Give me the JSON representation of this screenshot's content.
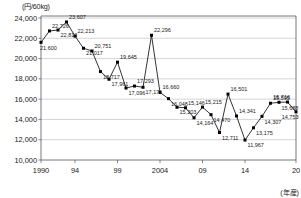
{
  "chart_data": {
    "type": "line",
    "title": "",
    "subtitle": "",
    "xlabel": "(年産)",
    "ylabel": "(円/60kg)",
    "unit_label": "(円/60kg)",
    "x_unit_label": "(年産)",
    "grid": true,
    "legend": "none",
    "ylim": [
      10000,
      24000
    ],
    "ytick_step": 2000,
    "y_ticks": [
      "10,000",
      "12,000",
      "14,000",
      "16,000",
      "18,000",
      "20,000",
      "22,000",
      "24,000"
    ],
    "y_tick_values": [
      10000,
      12000,
      14000,
      16000,
      18000,
      20000,
      22000,
      24000
    ],
    "x_ticks": [
      "1990",
      "94",
      "99",
      "2004",
      "09",
      "14",
      "20"
    ],
    "x_tick_values": [
      1990,
      1994,
      1999,
      2004,
      2009,
      2014,
      2020
    ],
    "xlim": [
      1990,
      2020
    ],
    "categories": [
      1990,
      1991,
      1992,
      1993,
      1994,
      1995,
      1996,
      1997,
      1998,
      1999,
      2000,
      2001,
      2002,
      2003,
      2004,
      2005,
      2006,
      2007,
      2008,
      2009,
      2010,
      2011,
      2012,
      2013,
      2014,
      2015,
      2016,
      2017,
      2018,
      2019,
      2020
    ],
    "values": [
      21600,
      22726,
      22813,
      23607,
      22213,
      21017,
      20751,
      18717,
      17961,
      19645,
      17096,
      17293,
      17171,
      22296,
      16660,
      16048,
      15203,
      15146,
      14164,
      15215,
      14470,
      12711,
      16501,
      14341,
      11967,
      13175,
      14307,
      15595,
      15688,
      15716,
      14753
    ],
    "point_labels": [
      "21,600",
      "22,726",
      "22,813",
      "23,607",
      "22,213",
      "21,017",
      "20,751",
      "18,717",
      "17,961",
      "19,645",
      "17,096",
      "17,293",
      "17,171",
      "22,296",
      "16,660",
      "16,048",
      "15,203",
      "15,146",
      "14,164",
      "15,215",
      "14,470",
      "12,711",
      "16,501",
      "14,341",
      "11,967",
      "13,175",
      "14,307",
      "15,595",
      "15,688",
      "15,716",
      "14,753"
    ],
    "label_positions": [
      "below",
      "above",
      "below",
      "above",
      "above",
      "below",
      "above",
      "below",
      "below",
      "above",
      "below",
      "above",
      "below",
      "above",
      "above",
      "below",
      "below",
      "above",
      "below",
      "above",
      "below",
      "below",
      "above",
      "above",
      "below",
      "below",
      "below",
      "above",
      "below",
      "above",
      "below"
    ],
    "series_color": "#000000",
    "grid_color": "#b9b9b9",
    "axis_color": "#555555",
    "marker": "square"
  }
}
